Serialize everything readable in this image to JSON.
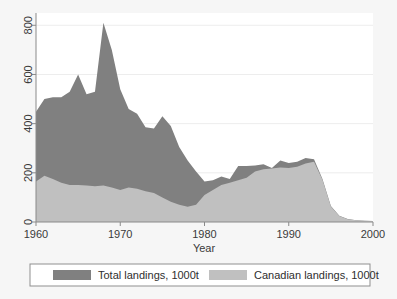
{
  "figure": {
    "background_color": "#f6f6f6",
    "plot_background_color": "#ffffff",
    "frame_color": "#9a9a9a",
    "grid_color": "#ededed",
    "axis_text_color": "#3a3a3a"
  },
  "legend": {
    "border_color": "#8f8f8f",
    "background_color": "#ffffff",
    "entries": [
      {
        "label": "Total landings, 1000t",
        "color": "#808080"
      },
      {
        "label": "Canadian landings, 1000t",
        "color": "#c0c0c0"
      }
    ]
  },
  "chart_data": {
    "type": "area",
    "title": "",
    "subtitle": "",
    "xlabel": "Year",
    "ylabel": "",
    "xlim": [
      1960,
      2000
    ],
    "ylim": [
      0,
      850
    ],
    "xticks": [
      1960,
      1970,
      1980,
      1990,
      2000
    ],
    "yticks": [
      0,
      200,
      400,
      600,
      800
    ],
    "grid": true,
    "grid_axis": "y",
    "legend_position": "below-plot",
    "stacking": "overlaid",
    "units": "1000 tonnes",
    "x": [
      1960,
      1961,
      1962,
      1963,
      1964,
      1965,
      1966,
      1967,
      1968,
      1969,
      1970,
      1971,
      1972,
      1973,
      1974,
      1975,
      1976,
      1977,
      1978,
      1979,
      1980,
      1981,
      1982,
      1983,
      1984,
      1985,
      1986,
      1987,
      1988,
      1989,
      1990,
      1991,
      1992,
      1993,
      1994,
      1995,
      1996,
      1997,
      1998,
      1999,
      2000
    ],
    "series": [
      {
        "name": "Total landings, 1000t",
        "color": "#808080",
        "values": [
          448,
          500,
          507,
          507,
          530,
          600,
          520,
          530,
          810,
          700,
          540,
          460,
          440,
          385,
          380,
          430,
          390,
          305,
          250,
          205,
          165,
          170,
          185,
          175,
          228,
          228,
          230,
          235,
          220,
          250,
          240,
          245,
          260,
          255,
          175,
          65,
          25,
          12,
          7,
          5,
          4
        ]
      },
      {
        "name": "Canadian landings, 1000t",
        "color": "#c0c0c0",
        "values": [
          165,
          188,
          175,
          160,
          150,
          150,
          148,
          145,
          148,
          140,
          130,
          140,
          135,
          125,
          118,
          100,
          82,
          70,
          62,
          70,
          110,
          130,
          150,
          160,
          170,
          180,
          205,
          215,
          218,
          222,
          220,
          225,
          238,
          245,
          172,
          63,
          24,
          11,
          7,
          5,
          4
        ]
      }
    ],
    "annotations": {
      "peak_year": 1968,
      "peak_value": 810,
      "collapse_start_year": 1993,
      "collapse_note": "Total landings fall to near zero after 1993"
    }
  }
}
